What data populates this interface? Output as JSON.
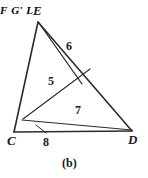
{
  "figure": {
    "caption": "(b)",
    "stroke_color": "#2b2b2b",
    "background_color": "#ffffff",
    "text_color": "#1a1a1a",
    "vertices": [
      {
        "id": "E",
        "label": "E",
        "x": 38,
        "y": 22
      },
      {
        "id": "C",
        "label": "C",
        "x": 14,
        "y": 132
      },
      {
        "id": "D",
        "label": "D",
        "x": 132,
        "y": 131
      },
      {
        "id": "F",
        "label": "F",
        "x": 88,
        "y": 71
      },
      {
        "id": "G",
        "label": "G'",
        "x": 82,
        "y": 83
      },
      {
        "id": "L",
        "label": "L",
        "x": 23,
        "y": 119
      }
    ],
    "vertex_labels": [
      {
        "name": "vertex-label-E",
        "text": "E",
        "left": 33,
        "top": 4
      },
      {
        "name": "vertex-label-C",
        "text": "C",
        "left": 7,
        "top": 134
      },
      {
        "name": "vertex-label-D",
        "text": "D",
        "left": 128,
        "top": 133
      },
      {
        "name": "point-label-F",
        "text": "F",
        "left": 88,
        "top": 62
      },
      {
        "name": "point-label-G",
        "text": "G'",
        "left": 78,
        "top": 80
      },
      {
        "name": "point-label-L",
        "text": "L",
        "left": 19,
        "top": 111
      }
    ],
    "region_labels": [
      {
        "name": "region-label-5",
        "text": "5",
        "left": 48,
        "top": 75
      },
      {
        "name": "region-label-7",
        "text": "7",
        "left": 75,
        "top": 104
      }
    ],
    "edge_labels": [
      {
        "name": "edge-label-6",
        "text": "6",
        "left": 66,
        "top": 40
      },
      {
        "name": "edge-label-8",
        "text": "8",
        "left": 43,
        "top": 136
      }
    ],
    "segments": [
      {
        "name": "segment-E-C",
        "from": "E",
        "to": "C"
      },
      {
        "name": "segment-E-D",
        "from": "E",
        "to": "D"
      },
      {
        "name": "segment-C-D",
        "from": "C",
        "to": "D"
      },
      {
        "name": "segment-E-G-sliver",
        "from": "E",
        "to": "G"
      },
      {
        "name": "segment-L-F",
        "from": "L",
        "to": "F"
      },
      {
        "name": "segment-L-D-sliver",
        "from": "L",
        "to": "D"
      }
    ],
    "leader_lines": [
      {
        "name": "leader-line-8",
        "x1": 46,
        "y1": 133,
        "x2": 36,
        "y2": 125
      }
    ]
  }
}
